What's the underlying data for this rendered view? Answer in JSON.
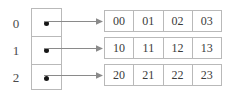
{
  "diagram": {
    "colors": {
      "border": "#b9b9b9",
      "text": "#3a3a3a",
      "label": "#4a4a4a",
      "dot": "#161616",
      "arrow": "#8a8a8a",
      "background": "#ffffff"
    },
    "row_labels": [
      "0",
      "1",
      "2"
    ],
    "pointer_cells": [
      {
        "index": "0",
        "marker": "filled-dot"
      },
      {
        "index": "1",
        "marker": "filled-dot"
      },
      {
        "index": "2",
        "marker": "filled-dot"
      }
    ],
    "arrows": [
      {
        "from": "pointer-cell-0",
        "to": "data-row-0",
        "direction": "right"
      },
      {
        "from": "pointer-cell-1",
        "to": "data-row-1",
        "direction": "right"
      },
      {
        "from": "pointer-cell-2",
        "to": "data-row-2",
        "direction": "right"
      }
    ],
    "data_rows": [
      {
        "label": "0",
        "cells": [
          "00",
          "01",
          "02",
          "03"
        ]
      },
      {
        "label": "1",
        "cells": [
          "10",
          "11",
          "12",
          "13"
        ]
      },
      {
        "label": "2",
        "cells": [
          "20",
          "21",
          "22",
          "23"
        ]
      }
    ]
  }
}
